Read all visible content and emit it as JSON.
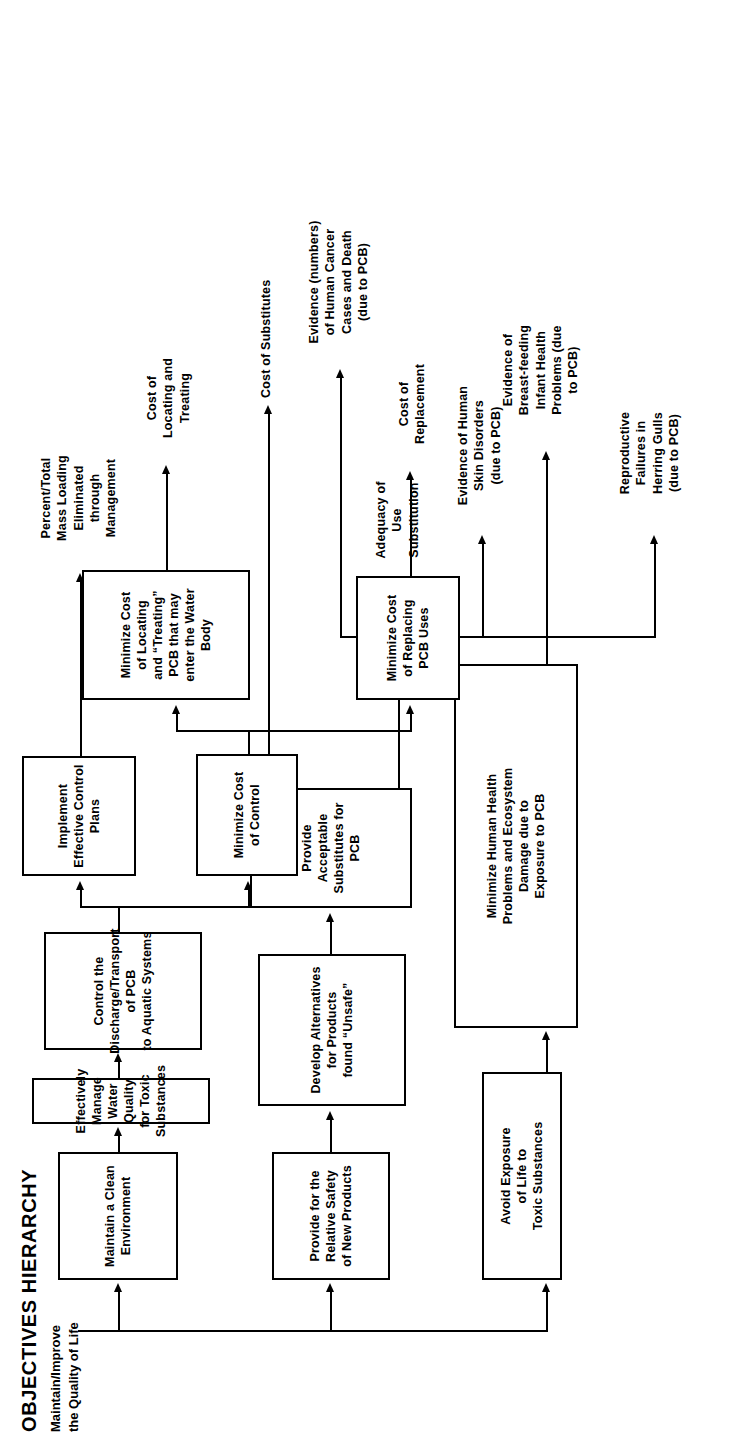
{
  "figure": {
    "title": "OBJECTIVES HIERARCHY",
    "root_label": "Maintain/Improve\nthe Quality of Life",
    "orientation": "rotated-90-ccw",
    "line_color": "#000000",
    "background_color": "#ffffff"
  },
  "nodes": {
    "avoid_exposure": "Avoid Exposure\nof Life to\nToxic Substances",
    "minimize_health": "Minimize Human Health\nProblems and Ecosystem\nDamage due to\nExposure to PCB",
    "relative_safety": "Provide for the\nRelative Safety\nof New Products",
    "develop_alternatives": "Develop Alternatives\nfor Products\nfound “Unsafe”",
    "provide_substitutes": "Provide Acceptable\nSubstitutes for PCB",
    "clean_environment": "Maintain a Clean\nEnvironment",
    "manage_water": "Effectively Manage Water Quality\nfor Toxic Substances",
    "control_discharge": "Control the\nDischarge/Transport of PCB\nto Aquatic Systems",
    "implement_plans": "Implement\nEffective Control\nPlans",
    "minimize_cost_control": "Minimize Cost\nof Control",
    "minimize_cost_locating": "Minimize Cost\nof Locating\nand “Treating”\nPCB that may\nenter the Water\nBody",
    "minimize_cost_replacing": "Minimize Cost\nof Replacing\nPCB Uses"
  },
  "measures": {
    "reproductive_failures": "Reproductive\nFailures in\nHerring Gulls\n(due to PCB)",
    "skin_disorders": "Evidence of Human\nSkin Disorders\n(due to PCB)",
    "breastfeeding": "Evidence of\nBreast-feeding\nInfant Health\nProblems (due\nto PCB)",
    "human_cancer": "Evidence (numbers)\nof Human Cancer\nCases and Death\n(due to PCB)",
    "adequacy_substitution": "Adequacy of\nUse\nSubstitution",
    "cost_substitutes": "Cost of Substitutes",
    "percent_mass_loading": "Percent/Total\nMass Loading\nEliminated\nthrough\nManagement",
    "cost_locating_treating": "Cost of\nLocating and\nTreating",
    "cost_replacement": "Cost of\nReplacement"
  }
}
